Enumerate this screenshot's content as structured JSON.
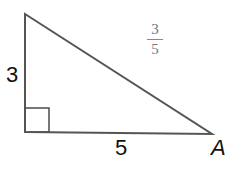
{
  "diagram": {
    "type": "right-triangle",
    "vertices": {
      "top": [
        25,
        14
      ],
      "right_angle": [
        25,
        132
      ],
      "A": [
        212,
        134
      ]
    },
    "side_labels": {
      "vertical_leg": "3",
      "horizontal_leg": "5"
    },
    "vertex_label": "A",
    "fraction": {
      "numerator": "3",
      "denominator": "5"
    },
    "colors": {
      "stroke": "#555555",
      "fraction": "#777777"
    }
  }
}
